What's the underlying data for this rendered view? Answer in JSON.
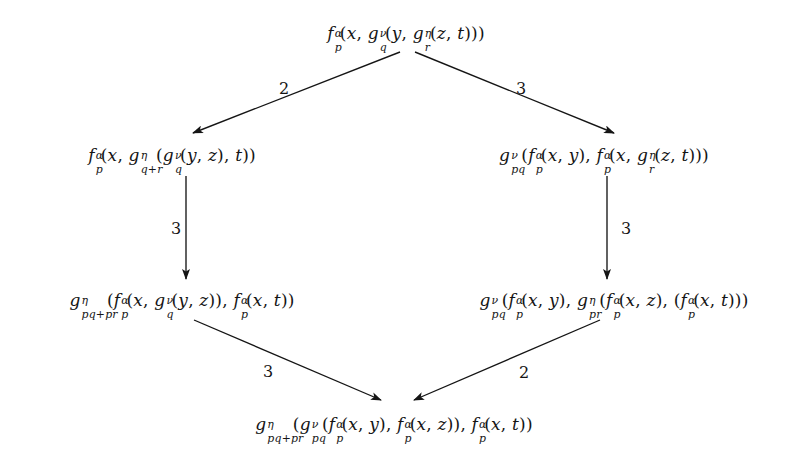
{
  "diagram": {
    "type": "commutative-hexagon",
    "title": "",
    "background_color": "#ffffff",
    "ink_color": "#151515",
    "nodes": [
      {
        "id": "top",
        "position": {
          "x": 406,
          "y": 33
        },
        "text": "f_p^α(x, g_q^ν(y, g_r^η(z, t)))",
        "parts": [
          {
            "base": "f",
            "sup": "α",
            "sub": "p"
          },
          {
            "lit": "("
          },
          {
            "base": "x"
          },
          {
            "lit": ", "
          },
          {
            "base": "g",
            "sup": "ν",
            "sub": "q"
          },
          {
            "lit": "("
          },
          {
            "base": "y"
          },
          {
            "lit": ", "
          },
          {
            "base": "g",
            "sup": "η",
            "sub": "r"
          },
          {
            "lit": "("
          },
          {
            "base": "z"
          },
          {
            "lit": ", "
          },
          {
            "base": "t"
          },
          {
            "lit": ")))"
          }
        ]
      },
      {
        "id": "middle-left",
        "position": {
          "x": 172,
          "y": 155
        },
        "text": "f_p^α(x, g_{q+r}^η(g_q^ν(y, z), t))",
        "parts": [
          {
            "base": "f",
            "sup": "α",
            "sub": "p"
          },
          {
            "lit": "("
          },
          {
            "base": "x"
          },
          {
            "lit": ", "
          },
          {
            "base": "g",
            "sup": "η",
            "sub": "q+r"
          },
          {
            "lit": "("
          },
          {
            "base": "g",
            "sup": "ν",
            "sub": "q"
          },
          {
            "lit": "("
          },
          {
            "base": "y"
          },
          {
            "lit": ", "
          },
          {
            "base": "z"
          },
          {
            "lit": "), "
          },
          {
            "base": "t"
          },
          {
            "lit": "))"
          }
        ]
      },
      {
        "id": "middle-right",
        "position": {
          "x": 604,
          "y": 155
        },
        "text": "g_{pq}^ν(f_p^α(x, y), f_p^α(x, g_r^η(z, t)))",
        "parts": [
          {
            "base": "g",
            "sup": "ν",
            "sub": "pq"
          },
          {
            "lit": "("
          },
          {
            "base": "f",
            "sup": "α",
            "sub": "p"
          },
          {
            "lit": "("
          },
          {
            "base": "x"
          },
          {
            "lit": ", "
          },
          {
            "base": "y"
          },
          {
            "lit": "), "
          },
          {
            "base": "f",
            "sup": "α",
            "sub": "p"
          },
          {
            "lit": "("
          },
          {
            "base": "x"
          },
          {
            "lit": ", "
          },
          {
            "base": "g",
            "sup": "η",
            "sub": "r"
          },
          {
            "lit": "("
          },
          {
            "base": "z"
          },
          {
            "lit": ", "
          },
          {
            "base": "t"
          },
          {
            "lit": ")))"
          }
        ]
      },
      {
        "id": "bottom-left",
        "position": {
          "x": 182,
          "y": 300
        },
        "text": "g_{pq+pr}^η(f_p^α(x, g_q^ν(y, z)), f_p^α(x, t))",
        "parts": [
          {
            "base": "g",
            "sup": "η",
            "sub": "pq+pr"
          },
          {
            "lit": "("
          },
          {
            "base": "f",
            "sup": "α",
            "sub": "p"
          },
          {
            "lit": "("
          },
          {
            "base": "x"
          },
          {
            "lit": ", "
          },
          {
            "base": "g",
            "sup": "ν",
            "sub": "q"
          },
          {
            "lit": "("
          },
          {
            "base": "y"
          },
          {
            "lit": ", "
          },
          {
            "base": "z"
          },
          {
            "lit": ")), "
          },
          {
            "base": "f",
            "sup": "α",
            "sub": "p"
          },
          {
            "lit": "("
          },
          {
            "base": "x"
          },
          {
            "lit": ", "
          },
          {
            "base": "t"
          },
          {
            "lit": "))"
          }
        ]
      },
      {
        "id": "bottom-right",
        "position": {
          "x": 614,
          "y": 300
        },
        "text": "g_{pq}^ν(f_p^α(x, y), g_{pr}^η(f_p^α(x, z), (f_p^α(x, t))))",
        "parts": [
          {
            "base": "g",
            "sup": "ν",
            "sub": "pq"
          },
          {
            "lit": "("
          },
          {
            "base": "f",
            "sup": "α",
            "sub": "p"
          },
          {
            "lit": "("
          },
          {
            "base": "x"
          },
          {
            "lit": ", "
          },
          {
            "base": "y"
          },
          {
            "lit": "), "
          },
          {
            "base": "g",
            "sup": "η",
            "sub": "pr"
          },
          {
            "lit": "("
          },
          {
            "base": "f",
            "sup": "α",
            "sub": "p"
          },
          {
            "lit": "("
          },
          {
            "base": "x"
          },
          {
            "lit": ", "
          },
          {
            "base": "z"
          },
          {
            "lit": "), ("
          },
          {
            "base": "f",
            "sup": "α",
            "sub": "p"
          },
          {
            "lit": "("
          },
          {
            "base": "x"
          },
          {
            "lit": ", "
          },
          {
            "base": "t"
          },
          {
            "lit": ")))"
          }
        ]
      },
      {
        "id": "bottom",
        "position": {
          "x": 394,
          "y": 424
        },
        "text": "g_{pq+pr}^η(g_{pq}^ν(f_p^α(x, y), f_p^α(x, z)), f_p^α(x, t))",
        "parts": [
          {
            "base": "g",
            "sup": "η",
            "sub": "pq+pr"
          },
          {
            "lit": "("
          },
          {
            "base": "g",
            "sup": "ν",
            "sub": "pq"
          },
          {
            "lit": "("
          },
          {
            "base": "f",
            "sup": "α",
            "sub": "p"
          },
          {
            "lit": "("
          },
          {
            "base": "x"
          },
          {
            "lit": ", "
          },
          {
            "base": "y"
          },
          {
            "lit": "), "
          },
          {
            "base": "f",
            "sup": "α",
            "sub": "p"
          },
          {
            "lit": "("
          },
          {
            "base": "x"
          },
          {
            "lit": ", "
          },
          {
            "base": "z"
          },
          {
            "lit": ")), "
          },
          {
            "base": "f",
            "sup": "α",
            "sub": "p"
          },
          {
            "lit": "("
          },
          {
            "base": "x"
          },
          {
            "lit": ", "
          },
          {
            "base": "t"
          },
          {
            "lit": "))"
          }
        ]
      }
    ],
    "edges": [
      {
        "id": "top-to-middle-left",
        "from": "top",
        "to": "middle-left",
        "label": "2",
        "label_position": {
          "x": 284,
          "y": 88
        },
        "x1": 400,
        "y1": 52,
        "x2": 193,
        "y2": 133
      },
      {
        "id": "top-to-middle-right",
        "from": "top",
        "to": "middle-right",
        "label": "3",
        "label_position": {
          "x": 521,
          "y": 88
        },
        "x1": 415,
        "y1": 52,
        "x2": 614,
        "y2": 133
      },
      {
        "id": "middle-left-to-bottom-left",
        "from": "middle-left",
        "to": "bottom-left",
        "label": "3",
        "label_position": {
          "x": 176,
          "y": 228
        },
        "x1": 186,
        "y1": 176,
        "x2": 186,
        "y2": 279
      },
      {
        "id": "middle-right-to-bottom-right",
        "from": "middle-right",
        "to": "bottom-right",
        "label": "3",
        "label_position": {
          "x": 626,
          "y": 228
        },
        "x1": 607,
        "y1": 176,
        "x2": 607,
        "y2": 279
      },
      {
        "id": "bottom-left-to-bottom",
        "from": "bottom-left",
        "to": "bottom",
        "label": "3",
        "label_position": {
          "x": 268,
          "y": 371
        },
        "x1": 194,
        "y1": 320,
        "x2": 381,
        "y2": 400
      },
      {
        "id": "bottom-right-to-bottom",
        "from": "bottom-right",
        "to": "bottom",
        "label": "2",
        "label_position": {
          "x": 524,
          "y": 372
        },
        "x1": 600,
        "y1": 320,
        "x2": 414,
        "y2": 400
      }
    ]
  }
}
